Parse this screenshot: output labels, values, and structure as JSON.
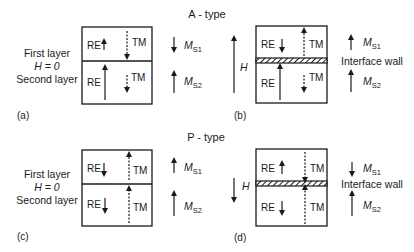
{
  "titles": {
    "a_type": "A - type",
    "p_type": "P - type"
  },
  "left_labels": {
    "first_layer": "First layer",
    "h_zero": "H = 0",
    "second_layer": "Second layer"
  },
  "panel_labels": {
    "a": "(a)",
    "b": "(b)",
    "c": "(c)",
    "d": "(d)"
  },
  "cell_labels": {
    "re": "RE",
    "tm": "TM"
  },
  "magnetization": {
    "m": "M",
    "s1": "S1",
    "s2": "S2"
  },
  "field": {
    "h": "H"
  },
  "interface_wall": "Interface wall",
  "panels": [
    {
      "id": "a",
      "type": "A",
      "field": "H = 0",
      "layer1": {
        "RE": "up",
        "TM": "down"
      },
      "layer2": {
        "RE": "up-long",
        "TM": "down-short"
      },
      "Ms1": "down",
      "Ms2": "up",
      "interface_wall": false
    },
    {
      "id": "b",
      "type": "A",
      "field": "H up",
      "layer1": {
        "RE": "down",
        "TM": "up"
      },
      "layer2": {
        "RE": "up-long",
        "TM": "down-short"
      },
      "Ms1": "up",
      "Ms2": "up",
      "interface_wall": true
    },
    {
      "id": "c",
      "type": "P",
      "field": "H = 0",
      "layer1": {
        "RE": "down",
        "TM": "up"
      },
      "layer2": {
        "RE": "down",
        "TM": "up"
      },
      "Ms1": "up",
      "Ms2": "up",
      "interface_wall": false
    },
    {
      "id": "d",
      "type": "P",
      "field": "H down",
      "layer1": {
        "RE": "up",
        "TM": "down"
      },
      "layer2": {
        "RE": "down",
        "TM": "up"
      },
      "Ms1": "down",
      "Ms2": "up",
      "interface_wall": true
    }
  ],
  "colors": {
    "ink": "#1a1a1a",
    "background": "#ffffff"
  }
}
